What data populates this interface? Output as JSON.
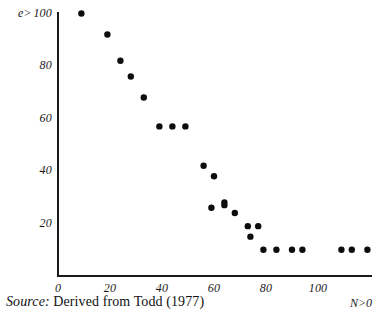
{
  "figure": {
    "source_note_label": "Source:",
    "source_note_text": " Derived from Todd (1977)"
  },
  "chart_data": {
    "type": "scatter",
    "title": "",
    "xlabel": "N>0",
    "ylabel": "e>",
    "xlim": [
      0,
      125
    ],
    "ylim": [
      0,
      105
    ],
    "grid": false,
    "legend": null,
    "xticks": [
      0,
      20,
      40,
      60,
      80,
      100
    ],
    "xtick_labels": [
      "0",
      "20",
      "40",
      "60",
      "80",
      "100"
    ],
    "yticks": [
      20,
      40,
      60,
      80,
      100
    ],
    "ytick_labels": [
      "20",
      "40",
      "60",
      "80",
      "100"
    ],
    "marker": "circle",
    "marker_color": "#0d0d0d",
    "marker_size": 4,
    "axis_color": "#1a1a1a",
    "points": [
      {
        "x": 9,
        "y": 100
      },
      {
        "x": 19,
        "y": 92
      },
      {
        "x": 24,
        "y": 82
      },
      {
        "x": 28,
        "y": 76
      },
      {
        "x": 33,
        "y": 68
      },
      {
        "x": 39,
        "y": 57
      },
      {
        "x": 44,
        "y": 57
      },
      {
        "x": 49,
        "y": 57
      },
      {
        "x": 56,
        "y": 42
      },
      {
        "x": 60,
        "y": 38
      },
      {
        "x": 59,
        "y": 26
      },
      {
        "x": 64,
        "y": 28
      },
      {
        "x": 64,
        "y": 27
      },
      {
        "x": 68,
        "y": 24
      },
      {
        "x": 73,
        "y": 19
      },
      {
        "x": 74,
        "y": 15
      },
      {
        "x": 77,
        "y": 19
      },
      {
        "x": 79,
        "y": 10
      },
      {
        "x": 84,
        "y": 10
      },
      {
        "x": 90,
        "y": 10
      },
      {
        "x": 94,
        "y": 10
      },
      {
        "x": 109,
        "y": 10
      },
      {
        "x": 113,
        "y": 10
      },
      {
        "x": 119,
        "y": 10
      }
    ]
  },
  "axes_geometry": {
    "origin_x_px": 58,
    "origin_y_px": 276,
    "x_px_per_unit": 2.6,
    "y_px_per_unit": 2.625,
    "x_axis_end_px": 372,
    "y_axis_top_px": 12
  }
}
